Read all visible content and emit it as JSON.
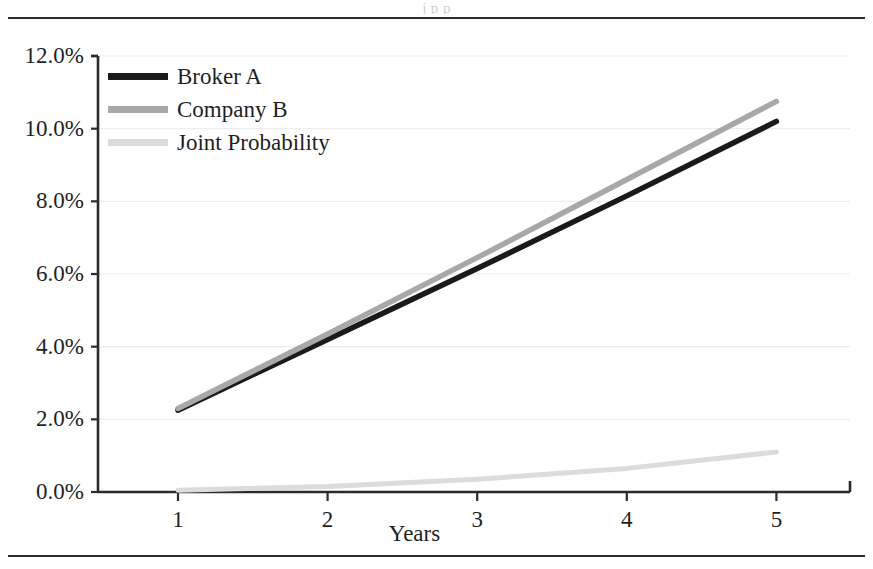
{
  "figure": {
    "top_rule": "",
    "bottom_rule": "",
    "caption_ghost": "j p p"
  },
  "legend": {
    "position": "top-left-inside",
    "items": [
      {
        "label": "Broker A",
        "color": "#1a1a1a"
      },
      {
        "label": "Company B",
        "color": "#a8a8a8"
      },
      {
        "label": "Joint Probability",
        "color": "#dcdcdc"
      }
    ]
  },
  "axes": {
    "x_title": "Years",
    "x_ticks": [
      "1",
      "2",
      "3",
      "4",
      "5"
    ],
    "y_ticks": [
      "0.0%",
      "2.0%",
      "4.0%",
      "6.0%",
      "8.0%",
      "10.0%",
      "12.0%"
    ]
  },
  "chart_data": {
    "type": "line",
    "title": "",
    "xlabel": "Years",
    "ylabel": "",
    "x": [
      1,
      2,
      3,
      4,
      5
    ],
    "categories": [
      "1",
      "2",
      "3",
      "4",
      "5"
    ],
    "xlim": [
      0.5,
      5.5
    ],
    "ylim": [
      0,
      12
    ],
    "y_tick_values": [
      0,
      2,
      4,
      6,
      8,
      10,
      12
    ],
    "y_unit": "%",
    "grid": "horizontal-faint",
    "legend_position": "upper left",
    "series": [
      {
        "name": "Broker A",
        "color": "#1a1a1a",
        "values": [
          2.25,
          4.2,
          6.15,
          8.15,
          10.2
        ]
      },
      {
        "name": "Company B",
        "color": "#a8a8a8",
        "values": [
          2.3,
          4.35,
          6.45,
          8.6,
          10.75
        ]
      },
      {
        "name": "Joint Probability",
        "color": "#dcdcdc",
        "values": [
          0.05,
          0.15,
          0.35,
          0.65,
          1.1
        ]
      }
    ]
  }
}
